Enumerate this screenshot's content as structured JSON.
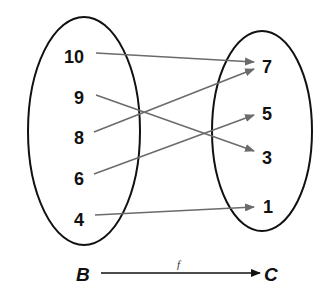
{
  "diagram": {
    "type": "mapping-diagram",
    "domain_set": {
      "name": "B",
      "elements": [
        "10",
        "9",
        "8",
        "6",
        "4"
      ]
    },
    "codomain_set": {
      "name": "C",
      "elements": [
        "7",
        "5",
        "3",
        "1"
      ]
    },
    "function_label": "f",
    "mappings": [
      {
        "from": "10",
        "to": "7"
      },
      {
        "from": "9",
        "to": "3"
      },
      {
        "from": "8",
        "to": "7"
      },
      {
        "from": "6",
        "to": "5"
      },
      {
        "from": "4",
        "to": "1"
      }
    ],
    "colors": {
      "ellipse": "#111111",
      "arrow": "#6b6b6b",
      "text": "#111111"
    }
  }
}
